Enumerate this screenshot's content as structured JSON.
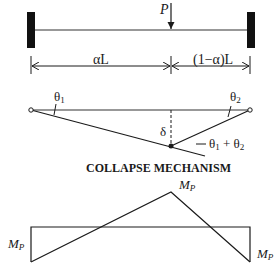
{
  "beam": {
    "load_label": "P",
    "left_span_label": "αL",
    "right_span_label": "(1−α)L"
  },
  "mechanism": {
    "theta1_label": "θ",
    "theta1_sub": "1",
    "theta2_label": "θ",
    "theta2_sub": "2",
    "delta_label": "δ",
    "sum_label_a": "θ",
    "sum_sub_a": "1",
    "sum_plus": " + θ",
    "sum_sub_b": "2",
    "title": "COLLAPSE MECHANISM"
  },
  "moment_diagram": {
    "peak_label": "M",
    "peak_sub": "P",
    "left_label": "M",
    "left_sub": "P",
    "right_label": "M",
    "right_sub": "P"
  },
  "colors": {
    "ink": "#1a1a1a",
    "background": "#ffffff"
  }
}
